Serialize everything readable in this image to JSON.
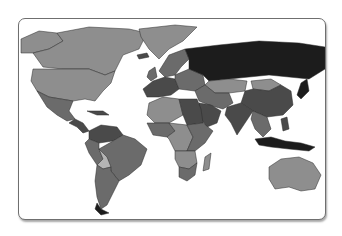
{
  "map": {
    "type": "choropleth",
    "projection": "world",
    "palette": "grayscale",
    "ocean_color": "#ffffff",
    "border_color": "#2a2a2a",
    "shade_levels": {
      "1": "#b4b4b4",
      "2": "#8e8e8e",
      "3": "#6b6b6b",
      "4": "#4a4a4a",
      "5": "#1c1c1c"
    },
    "regions": [
      {
        "name": "canada",
        "level": 2
      },
      {
        "name": "alaska",
        "level": 2
      },
      {
        "name": "greenland",
        "level": 2
      },
      {
        "name": "united-states",
        "level": 2
      },
      {
        "name": "mexico",
        "level": 3
      },
      {
        "name": "central-america",
        "level": 4
      },
      {
        "name": "cuba",
        "level": 4
      },
      {
        "name": "colombia-venezuela",
        "level": 4
      },
      {
        "name": "brazil",
        "level": 3
      },
      {
        "name": "peru",
        "level": 3
      },
      {
        "name": "bolivia",
        "level": 1
      },
      {
        "name": "argentina-chile",
        "level": 3
      },
      {
        "name": "patagonia-tip",
        "level": 5
      },
      {
        "name": "iceland",
        "level": 4
      },
      {
        "name": "scandinavia",
        "level": 3
      },
      {
        "name": "western-europe",
        "level": 4
      },
      {
        "name": "eastern-europe",
        "level": 3
      },
      {
        "name": "russia",
        "level": 5
      },
      {
        "name": "kazakhstan",
        "level": 2
      },
      {
        "name": "mongolia",
        "level": 2
      },
      {
        "name": "china",
        "level": 4
      },
      {
        "name": "middle-east",
        "level": 3
      },
      {
        "name": "arabia",
        "level": 4
      },
      {
        "name": "india",
        "level": 4
      },
      {
        "name": "southeast-asia",
        "level": 3
      },
      {
        "name": "japan",
        "level": 5
      },
      {
        "name": "indonesia",
        "level": 5
      },
      {
        "name": "philippines",
        "level": 4
      },
      {
        "name": "north-africa-west",
        "level": 2
      },
      {
        "name": "north-africa-east",
        "level": 4
      },
      {
        "name": "west-africa",
        "level": 3
      },
      {
        "name": "central-africa",
        "level": 2
      },
      {
        "name": "east-africa",
        "level": 3
      },
      {
        "name": "southern-africa",
        "level": 2
      },
      {
        "name": "south-africa",
        "level": 3
      },
      {
        "name": "madagascar",
        "level": 2
      },
      {
        "name": "australia",
        "level": 2
      },
      {
        "name": "uk-ireland",
        "level": 3
      }
    ]
  }
}
